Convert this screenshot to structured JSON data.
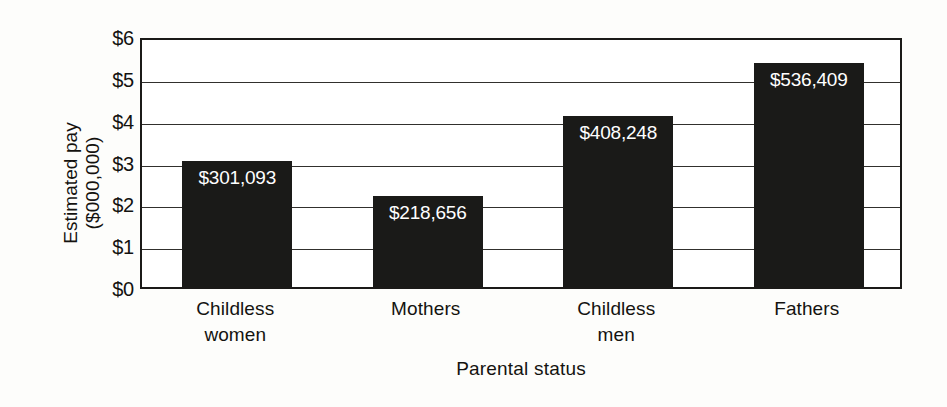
{
  "chart_data": {
    "type": "bar",
    "title": "",
    "xlabel": "Parental status",
    "ylabel": "Estimated pay ($000,000)",
    "ylabel_line1": "Estimated pay",
    "ylabel_line2": "($000,000)",
    "categories": [
      "Childless women",
      "Mothers",
      "Childless men",
      "Fathers"
    ],
    "category_lines": [
      [
        "Childless",
        "women"
      ],
      [
        "Mothers"
      ],
      [
        "Childless",
        "men"
      ],
      [
        "Fathers"
      ]
    ],
    "values": [
      3.01093,
      2.18656,
      4.08248,
      5.36409
    ],
    "value_labels": [
      "$301,093",
      "$218,656",
      "$408,248",
      "$536,409"
    ],
    "ylim": [
      0,
      6
    ],
    "ytick_values": [
      0,
      1,
      2,
      3,
      4,
      5,
      6
    ],
    "ytick_labels": [
      "$0",
      "$1",
      "$2",
      "$3",
      "$4",
      "$5",
      "$6"
    ],
    "grid": true,
    "legend": "none",
    "bar_color": "#1a1a18",
    "value_label_color": "#ffffff",
    "axis_color": "#1b1a18",
    "background_color": "#ffffff"
  }
}
